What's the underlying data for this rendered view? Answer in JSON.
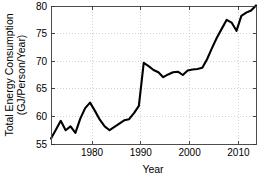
{
  "chart_data": {
    "type": "line",
    "title": "",
    "xlabel": "Year",
    "ylabel_line1": "Total Energy Consumption",
    "ylabel_line2": "(GJ/Person/Year)",
    "xlim": [
      1971,
      2013
    ],
    "ylim": [
      55,
      80
    ],
    "xticks": [
      1980,
      1990,
      2000,
      2010
    ],
    "xtick_labels": [
      "1980",
      "1990",
      "2000",
      "2010"
    ],
    "yticks": [
      55,
      60,
      65,
      70,
      75,
      80
    ],
    "ytick_labels": [
      "55",
      "60",
      "65",
      "70",
      "75",
      "80"
    ],
    "grid": true,
    "grid_style": "dotted",
    "legend": "none",
    "series": [
      {
        "name": "Total Energy Consumption",
        "color": "#000000",
        "x": [
          1971,
          1972,
          1973,
          1974,
          1975,
          1976,
          1977,
          1978,
          1979,
          1980,
          1981,
          1982,
          1983,
          1984,
          1985,
          1986,
          1987,
          1988,
          1989,
          1990,
          1991,
          1992,
          1993,
          1994,
          1995,
          1996,
          1997,
          1998,
          1999,
          2000,
          2001,
          2002,
          2003,
          2004,
          2005,
          2006,
          2007,
          2008,
          2009,
          2010,
          2011,
          2012,
          2013
        ],
        "values": [
          56.0,
          57.6,
          59.2,
          57.5,
          58.2,
          57.0,
          59.6,
          61.5,
          62.5,
          61.0,
          59.4,
          58.2,
          57.5,
          58.1,
          58.7,
          59.3,
          59.5,
          60.6,
          61.9,
          69.7,
          69.1,
          68.4,
          68.0,
          67.1,
          67.6,
          68.0,
          68.1,
          67.5,
          68.3,
          68.5,
          68.6,
          68.8,
          70.4,
          72.4,
          74.3,
          75.9,
          77.5,
          77.0,
          75.5,
          78.2,
          78.8,
          79.2,
          80.1
        ]
      }
    ]
  }
}
